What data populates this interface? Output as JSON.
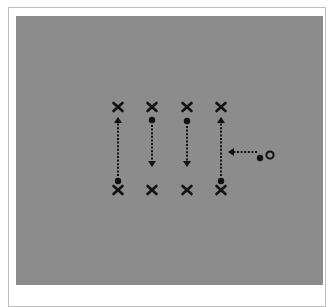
{
  "title": "",
  "colors": {
    "field": "#8c8c8c",
    "marker": "#111111",
    "frame_border": "#bdbdbd",
    "background": "#ffffff"
  },
  "diagram": {
    "type": "drill-diagram",
    "cones": [
      {
        "id": "top-1",
        "x": 118,
        "y": 107,
        "glyph": "X"
      },
      {
        "id": "top-2",
        "x": 152,
        "y": 107,
        "glyph": "X"
      },
      {
        "id": "top-3",
        "x": 187,
        "y": 107,
        "glyph": "X"
      },
      {
        "id": "top-4",
        "x": 221,
        "y": 107,
        "glyph": "X"
      },
      {
        "id": "bottom-1",
        "x": 118,
        "y": 190,
        "glyph": "X"
      },
      {
        "id": "bottom-2",
        "x": 152,
        "y": 190,
        "glyph": "X"
      },
      {
        "id": "bottom-3",
        "x": 187,
        "y": 190,
        "glyph": "X"
      },
      {
        "id": "bottom-4",
        "x": 221,
        "y": 190,
        "glyph": "X"
      }
    ],
    "players": [
      {
        "id": "player-1",
        "x": 118,
        "y": 181
      },
      {
        "id": "player-2",
        "x": 152,
        "y": 120
      },
      {
        "id": "player-3",
        "x": 187,
        "y": 121
      },
      {
        "id": "player-4",
        "x": 221,
        "y": 181
      },
      {
        "id": "player-5",
        "x": 260,
        "y": 158
      }
    ],
    "ball": {
      "x": 270,
      "y": 155,
      "glyph": "o"
    },
    "runs": [
      {
        "id": "run-1",
        "direction": "up",
        "x1": 118,
        "y1": 176,
        "x2": 118,
        "y2": 118
      },
      {
        "id": "run-2",
        "direction": "down",
        "x1": 152,
        "y1": 125,
        "x2": 152,
        "y2": 166
      },
      {
        "id": "run-3",
        "direction": "down",
        "x1": 187,
        "y1": 126,
        "x2": 187,
        "y2": 166
      },
      {
        "id": "run-4",
        "direction": "up",
        "x1": 221,
        "y1": 176,
        "x2": 221,
        "y2": 118
      },
      {
        "id": "run-5",
        "direction": "left",
        "x1": 257,
        "y1": 152,
        "x2": 229,
        "y2": 152
      }
    ]
  }
}
